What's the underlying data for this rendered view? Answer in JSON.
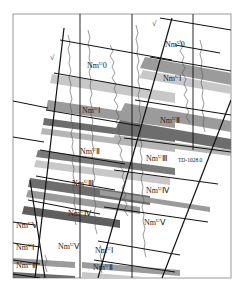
{
  "diagram": {
    "type": "geological-cross-section",
    "frame": {
      "x": 13,
      "y": 14,
      "width": 218,
      "height": 264,
      "border_color": "#9a9a9a"
    },
    "colors": {
      "fault_line": "#111111",
      "band_dark": "#6d6d6d",
      "band_mid": "#9b9b9b",
      "band_light": "#c8c8c8",
      "log_curve": "#555555"
    },
    "fault_marks": [
      {
        "symbol": "√",
        "x": 50,
        "y": 60
      },
      {
        "symbol": "√",
        "x": 152,
        "y": 26
      }
    ],
    "labels": [
      {
        "id": "nm0",
        "base": "Nm",
        "sup": "U",
        "unit": "0",
        "x": 87,
        "y": 68
      },
      {
        "id": "nm1-a",
        "base": "Nm",
        "sup": "U",
        "unit": "Ⅰ",
        "x": 82,
        "y": 113
      },
      {
        "id": "nm2-a",
        "base": "Nm",
        "sup": "U",
        "unit": "Ⅱ",
        "x": 80,
        "y": 154
      },
      {
        "id": "nm3-a",
        "base": "Nm",
        "sup": "U",
        "unit": "Ⅲ",
        "x": 72,
        "y": 186
      },
      {
        "id": "nm4-a",
        "base": "Nm",
        "sup": "U",
        "unit": "Ⅳ",
        "x": 68,
        "y": 216
      },
      {
        "id": "nm5-a",
        "base": "Nm",
        "sup": "U",
        "unit": "Ⅴ",
        "x": 58,
        "y": 249
      },
      {
        "id": "nm-top-right",
        "base": "Nm",
        "sup": "U",
        "unit": "0",
        "x": 165,
        "y": 47
      },
      {
        "id": "nm1-b",
        "base": "Nm",
        "sup": "U",
        "unit": "Ⅰ",
        "x": 163,
        "y": 81
      },
      {
        "id": "nm2-b",
        "base": "Nm",
        "sup": "U",
        "unit": "Ⅱ",
        "x": 160,
        "y": 123
      },
      {
        "id": "nm3-b",
        "base": "Nm",
        "sup": "U",
        "unit": "Ⅲ",
        "x": 146,
        "y": 161
      },
      {
        "id": "nm4-b",
        "base": "Nm",
        "sup": "U",
        "unit": "Ⅳ",
        "x": 146,
        "y": 193
      },
      {
        "id": "nm5-b",
        "base": "Nm",
        "sup": "U",
        "unit": "Ⅴ",
        "x": 144,
        "y": 225
      },
      {
        "id": "nm5-c",
        "base": "Nm",
        "sup": "U",
        "unit": "Ⅴ",
        "x": 16,
        "y": 228
      },
      {
        "id": "nm1-c",
        "base": "Nm",
        "sup": "U",
        "unit": "Ⅰ",
        "x": 16,
        "y": 250
      },
      {
        "id": "nm2-c",
        "base": "Nm",
        "sup": "U",
        "unit": "Ⅱ",
        "x": 16,
        "y": 268
      },
      {
        "id": "nm1-d",
        "base": "Nm",
        "sup": "U",
        "unit": "Ⅰ",
        "x": 95,
        "y": 253
      },
      {
        "id": "nm2-d",
        "base": "Nm",
        "sup": "U",
        "unit": "Ⅱ",
        "x": 93,
        "y": 270
      }
    ],
    "annotation": {
      "text": "TD-1028.0",
      "x": 178,
      "y": 162
    }
  }
}
